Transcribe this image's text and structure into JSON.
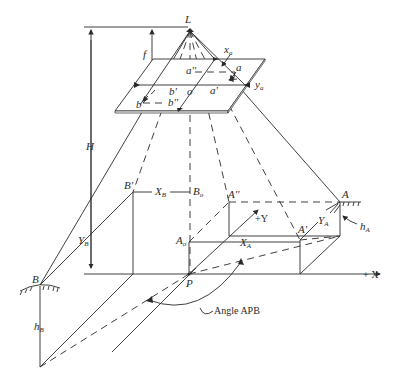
{
  "diagram": {
    "title": "",
    "labels": {
      "L": "L",
      "H": "H",
      "f": "f",
      "x_a": "x",
      "x_a_sub": "a",
      "y_a": "y",
      "y_a_sub": "a",
      "a": "a",
      "a_dprime": "a''",
      "a_prime": "a'",
      "b": "b",
      "b_prime": "b'",
      "b_dprime": "b''",
      "o": "o",
      "B_prime": "B'",
      "X_B": "X",
      "X_B_sub": "B",
      "B_o": "B",
      "B_o_sub": "o",
      "A_dprime": "A''",
      "plus_Y": "+Y",
      "A": "A",
      "Y_A": "Y",
      "Y_A_sub": "A",
      "h_A": "h",
      "h_A_sub": "A",
      "A_o": "A",
      "A_o_sub": "o",
      "X_A": "X",
      "X_A_sub": "A",
      "A_prime": "A'",
      "plus_X": "+ X",
      "Y_B": "Y",
      "Y_B_sub": "B",
      "B": "B",
      "P": "P",
      "h_B": "h",
      "h_B_sub": "B",
      "angle": "Angle APB"
    }
  }
}
